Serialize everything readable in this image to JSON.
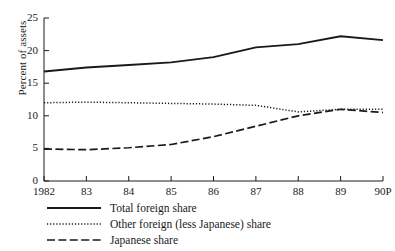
{
  "chart_data": {
    "type": "line",
    "title": "",
    "xlabel": "",
    "ylabel": "Percent of assets",
    "grid": false,
    "legend_position": "below-left",
    "x": [
      "1982",
      "83",
      "84",
      "85",
      "86",
      "87",
      "88",
      "89",
      "90P"
    ],
    "xtick_labels": [
      "1982",
      "83",
      "84",
      "85",
      "86",
      "87",
      "88",
      "89",
      "90P"
    ],
    "ytick_labels": [
      "0",
      "5",
      "10",
      "15",
      "20",
      "25"
    ],
    "ytick_values": [
      0,
      5,
      10,
      15,
      20,
      25
    ],
    "ylim": [
      0,
      25
    ],
    "xlim": [
      0,
      8
    ],
    "series": [
      {
        "name": "Total foreign share",
        "style": "solid",
        "color": "#1a1a1a",
        "values": [
          16.8,
          17.4,
          17.8,
          18.2,
          19.0,
          20.5,
          21.0,
          22.2,
          21.6
        ]
      },
      {
        "name": "Other foreign (less Japanese) share",
        "style": "dotted",
        "color": "#1a1a1a",
        "values": [
          12.0,
          12.1,
          12.0,
          11.9,
          11.8,
          11.6,
          10.6,
          11.0,
          11.0
        ]
      },
      {
        "name": "Japanese share",
        "style": "dashed",
        "color": "#1a1a1a",
        "values": [
          4.9,
          4.8,
          5.1,
          5.6,
          6.8,
          8.4,
          10.0,
          11.0,
          10.5
        ]
      }
    ]
  },
  "legend": {
    "items": [
      {
        "label": "Total foreign share",
        "style": "solid"
      },
      {
        "label": "Other foreign (less Japanese) share",
        "style": "dotted"
      },
      {
        "label": "Japanese share",
        "style": "dashed"
      }
    ]
  },
  "axes": {
    "y_axis_title": "Percent of assets"
  }
}
